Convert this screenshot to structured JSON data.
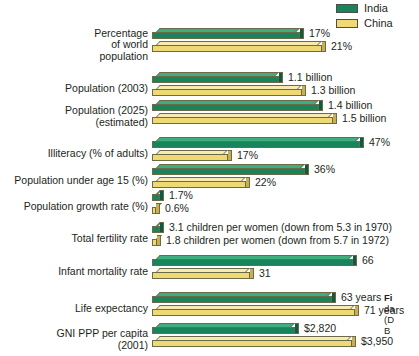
{
  "legend": {
    "items": [
      {
        "label": "India",
        "color": "#17845c"
      },
      {
        "label": "China",
        "color": "#efd974"
      }
    ]
  },
  "caption": {
    "line1": "Fi",
    "line2": "da",
    "line3": "(D",
    "line4": "B"
  },
  "chart_data": {
    "type": "bar",
    "title": "",
    "xlabel": "",
    "ylabel": "",
    "orientation": "horizontal",
    "grid": false,
    "legend_position": "top-right",
    "note": "Grouped horizontal 3-D bar chart comparing India and China. Each indicator row is scaled independently; values are printed at the end of each bar.",
    "series": [
      {
        "name": "India",
        "color": "#17845c"
      },
      {
        "name": "China",
        "color": "#efd974"
      }
    ],
    "categories": [
      "Percentage of world population",
      "Population (2003)",
      "Population (2025) (estimated)",
      "Illiteracy (% of adults)",
      "Population under age 15 (%)",
      "Population growth rate (%)",
      "Total fertility rate",
      "Infant mortality rate",
      "Life expectancy",
      "GNI PPP per capita (2001)"
    ],
    "rows": [
      {
        "label": "Percentage\nof world\npopulation",
        "india": {
          "value": 17,
          "label": "17%",
          "bar_px": 148
        },
        "china": {
          "value": 21,
          "label": "21%",
          "bar_px": 170
        }
      },
      {
        "label": "Population (2003)",
        "india": {
          "value": 1.1,
          "label": "1.1 billion",
          "bar_px": 127
        },
        "china": {
          "value": 1.3,
          "label": "1.3 billion",
          "bar_px": 150
        }
      },
      {
        "label": "Population (2025)\n(estimated)",
        "india": {
          "value": 1.4,
          "label": "1.4 billion",
          "bar_px": 167
        },
        "china": {
          "value": 1.5,
          "label": "1.5 billion",
          "bar_px": 181
        }
      },
      {
        "label": "Illiteracy (% of adults)",
        "india": {
          "value": 47,
          "label": "47%",
          "bar_px": 208
        },
        "china": {
          "value": 17,
          "label": "17%",
          "bar_px": 76
        }
      },
      {
        "label": "Population under age 15 (%)",
        "india": {
          "value": 36,
          "label": "36%",
          "bar_px": 153
        },
        "china": {
          "value": 22,
          "label": "22%",
          "bar_px": 94
        }
      },
      {
        "label": "Population growth rate (%)",
        "india": {
          "value": 1.7,
          "label": "1.7%",
          "bar_px": 8
        },
        "china": {
          "value": 0.6,
          "label": "0.6%",
          "bar_px": 4
        }
      },
      {
        "label": "Total fertility rate",
        "india": {
          "value": 3.1,
          "label": "3.1 children per women (down from 5.3 in 1970)",
          "bar_px": 8
        },
        "china": {
          "value": 1.8,
          "label": "1.8 children per women (down from 5.7 in 1972)",
          "bar_px": 5
        }
      },
      {
        "label": "Infant mortality rate",
        "india": {
          "value": 66,
          "label": "66",
          "bar_px": 201
        },
        "china": {
          "value": 31,
          "label": "31",
          "bar_px": 98
        }
      },
      {
        "label": "Life expectancy",
        "india": {
          "value": 63,
          "label": "63 years",
          "bar_px": 180
        },
        "china": {
          "value": 71,
          "label": "71 years",
          "bar_px": 203
        }
      },
      {
        "label": "GNI PPP per capita\n(2001)",
        "india": {
          "value": 2820,
          "label": "$2,820",
          "bar_px": 143
        },
        "china": {
          "value": 3950,
          "label": "$3,950",
          "bar_px": 200
        }
      }
    ]
  },
  "layout": {
    "row_tops": [
      28,
      72,
      100,
      137,
      164,
      190,
      222,
      255,
      292,
      323
    ],
    "bar_left": 152
  }
}
